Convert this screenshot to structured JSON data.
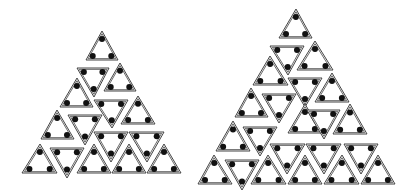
{
  "figures": [
    {
      "name": "left-triangle-arrangement",
      "tile_count": 15,
      "dots_per_tile": 3,
      "tiles": [
        {
          "orientation": "up"
        },
        {
          "orientation": "down"
        },
        {
          "orientation": "up"
        },
        {
          "orientation": "up"
        },
        {
          "orientation": "down"
        },
        {
          "orientation": "up"
        },
        {
          "orientation": "up"
        },
        {
          "orientation": "down"
        },
        {
          "orientation": "down"
        },
        {
          "orientation": "down"
        },
        {
          "orientation": "up"
        },
        {
          "orientation": "down"
        },
        {
          "orientation": "up"
        },
        {
          "orientation": "up"
        },
        {
          "orientation": "up"
        }
      ]
    },
    {
      "name": "right-triangle-arrangement",
      "tile_count": 22,
      "dots_per_tile": 3,
      "tiles": [
        {
          "orientation": "up"
        },
        {
          "orientation": "down"
        },
        {
          "orientation": "up"
        },
        {
          "orientation": "up"
        },
        {
          "orientation": "down"
        },
        {
          "orientation": "up"
        },
        {
          "orientation": "up"
        },
        {
          "orientation": "down"
        },
        {
          "orientation": "up"
        },
        {
          "orientation": "down"
        },
        {
          "orientation": "up"
        },
        {
          "orientation": "up"
        },
        {
          "orientation": "down"
        },
        {
          "orientation": "down"
        },
        {
          "orientation": "down"
        },
        {
          "orientation": "down"
        },
        {
          "orientation": "up"
        },
        {
          "orientation": "down"
        },
        {
          "orientation": "up"
        },
        {
          "orientation": "up"
        },
        {
          "orientation": "up"
        },
        {
          "orientation": "up"
        }
      ]
    }
  ],
  "colors": {
    "stroke": "#444444",
    "dot": "#111111",
    "background": "#ffffff"
  }
}
